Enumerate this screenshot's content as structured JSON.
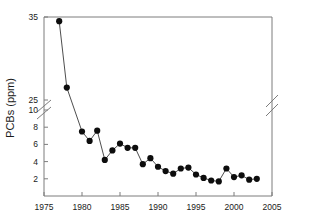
{
  "chart_data": {
    "type": "line",
    "title": "",
    "subtitle": "",
    "xlabel": "",
    "ylabel": "PCBs (ppm)",
    "grid": false,
    "legend": null,
    "xlim": [
      1975,
      2005
    ],
    "ylim": [
      0,
      35
    ],
    "x_ticks": [
      1975,
      1980,
      1985,
      1990,
      1995,
      2000,
      2005
    ],
    "x_tick_labels": [
      "1975",
      "1980",
      "1985",
      "1990",
      "1995",
      "2000",
      "2005"
    ],
    "y_ticks": [
      2,
      4,
      6,
      8,
      10,
      25,
      35
    ],
    "y_tick_labels": [
      "2",
      "4",
      "6",
      "8",
      "10",
      "25",
      "35"
    ],
    "y_axis_break": {
      "present": true,
      "lower_value": 10,
      "upper_value": 25,
      "note": "axis break drawn as double diagonal slash between 10 and 25"
    },
    "x_axis_break": {
      "present": true,
      "note": "double diagonal slash on right frame edge near 2005"
    },
    "markers": "filled-circle",
    "series": [
      {
        "name": "PCBs",
        "x": [
          1977,
          1978,
          1980,
          1981,
          1982,
          1983,
          1984,
          1985,
          1986,
          1987,
          1988,
          1989,
          1990,
          1991,
          1992,
          1993,
          1994,
          1995,
          1996,
          1997,
          1998,
          1999,
          2000,
          2001,
          2002,
          2003
        ],
        "values": [
          34.5,
          26.5,
          7.5,
          6.4,
          7.6,
          4.2,
          5.3,
          6.1,
          5.6,
          5.6,
          3.7,
          4.4,
          3.4,
          2.9,
          2.6,
          3.2,
          3.3,
          2.5,
          2.1,
          1.8,
          1.7,
          3.2,
          2.2,
          2.4,
          1.9,
          2.0
        ]
      }
    ]
  },
  "axis": {
    "ylabel": "PCBs (ppm)"
  }
}
